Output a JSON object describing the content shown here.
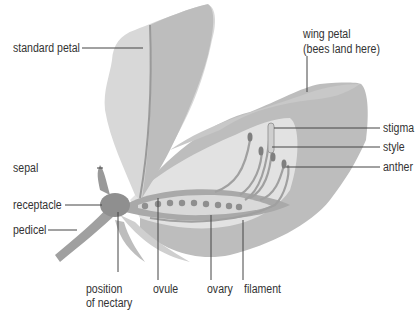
{
  "diagram": {
    "labels": {
      "standard_petal": "standard petal",
      "wing_petal_line1": "wing petal",
      "wing_petal_line2": "(bees land here)",
      "stigma": "stigma",
      "style": "style",
      "anther": "anther",
      "sepal": "sepal",
      "receptacle": "receptacle",
      "pedicel": "pedicel",
      "nectary_line1": "position",
      "nectary_line2": "of nectary",
      "ovule": "ovule",
      "ovary": "ovary",
      "filament": "filament"
    },
    "colors": {
      "petal_light": "#d6d6d6",
      "petal_mid": "#bdbdbd",
      "petal_dark": "#a9a9a9",
      "structure": "#8f8f8f",
      "inner_light": "#e4e4e4",
      "leader_line": "#444444",
      "text": "#333333"
    }
  }
}
